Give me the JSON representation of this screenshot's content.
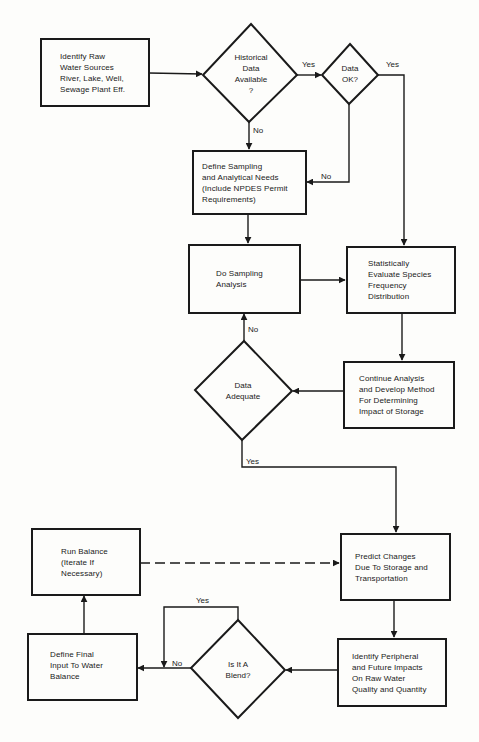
{
  "diagram": {
    "type": "flowchart",
    "nodes": {
      "identify_raw": {
        "shape": "process",
        "label": "Identify Raw\nWater Sources\nRiver, Lake, Well,\nSewage Plant Eff."
      },
      "historical_data": {
        "shape": "decision",
        "label": "Historical\nData\nAvailable\n?"
      },
      "data_ok": {
        "shape": "decision",
        "label": "Data\nOK?"
      },
      "define_sampling": {
        "shape": "process",
        "label": "Define Sampling\nand Analytical Needs\n(Include NPDES Permit\nRequirements)"
      },
      "do_sampling": {
        "shape": "process",
        "label": "Do Sampling\nAnalysis"
      },
      "statistically_evaluate": {
        "shape": "process",
        "label": "Statistically\nEvaluate Species\nFrequency\nDistribution"
      },
      "data_adequate": {
        "shape": "decision",
        "label": "Data\nAdequate"
      },
      "continue_analysis": {
        "shape": "process",
        "label": "Continue Analysis\nand Develop Method\nFor Determining\nImpact of Storage"
      },
      "run_balance": {
        "shape": "process",
        "label": "Run Balance\n(Iterate If\nNecessary)"
      },
      "predict_changes": {
        "shape": "process",
        "label": "Predict Changes\nDue To Storage and\nTransportation"
      },
      "define_final": {
        "shape": "process",
        "label": "Define Final\nInput To Water\nBalance"
      },
      "is_blend": {
        "shape": "decision",
        "label": "Is It A\nBlend?"
      },
      "identify_peripheral": {
        "shape": "process",
        "label": "Identify Peripheral\nand Future Impacts\nOn Raw Water\nQuality and Quantity"
      }
    },
    "edges": [
      {
        "from": "identify_raw",
        "to": "historical_data",
        "label": ""
      },
      {
        "from": "historical_data",
        "to": "data_ok",
        "label": "Yes"
      },
      {
        "from": "historical_data",
        "to": "define_sampling",
        "label": "No"
      },
      {
        "from": "data_ok",
        "to": "statistically_evaluate",
        "label": "Yes"
      },
      {
        "from": "data_ok",
        "to": "define_sampling",
        "label": "No"
      },
      {
        "from": "define_sampling",
        "to": "do_sampling",
        "label": ""
      },
      {
        "from": "do_sampling",
        "to": "statistically_evaluate",
        "label": ""
      },
      {
        "from": "statistically_evaluate",
        "to": "continue_analysis",
        "label": ""
      },
      {
        "from": "continue_analysis",
        "to": "data_adequate",
        "label": ""
      },
      {
        "from": "data_adequate",
        "to": "do_sampling",
        "label": "No"
      },
      {
        "from": "data_adequate",
        "to": "predict_changes",
        "label": "Yes"
      },
      {
        "from": "run_balance",
        "to": "predict_changes",
        "label": "",
        "style": "dashed"
      },
      {
        "from": "predict_changes",
        "to": "identify_peripheral",
        "label": ""
      },
      {
        "from": "identify_peripheral",
        "to": "is_blend",
        "label": ""
      },
      {
        "from": "is_blend",
        "to": "define_final",
        "label": "No"
      },
      {
        "from": "is_blend",
        "to": "define_final",
        "label": "Yes",
        "route": "loop-over-top"
      },
      {
        "from": "define_final",
        "to": "run_balance",
        "label": ""
      }
    ]
  },
  "edge_labels": {
    "hist_yes": "Yes",
    "hist_no": "No",
    "ok_yes": "Yes",
    "ok_no": "No",
    "adequate_no": "No",
    "adequate_yes": "Yes",
    "blend_yes": "Yes",
    "blend_no": "No"
  },
  "colors": {
    "ink": "#1a1a1a",
    "paper": "#fdfdfb"
  }
}
